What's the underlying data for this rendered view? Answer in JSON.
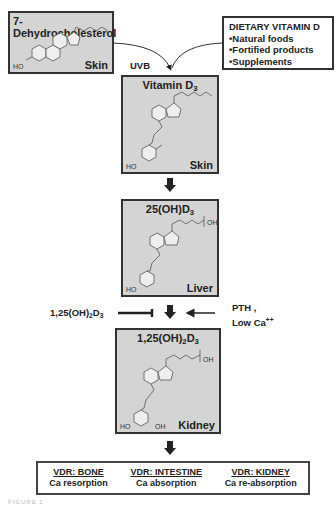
{
  "boxes": {
    "dehydrocholesterol": {
      "title": "7-Dehydrocholesterol",
      "location": "Skin",
      "ho": "HO"
    },
    "vitamin_d3": {
      "title_main": "Vitamin D",
      "title_sub": "3",
      "location": "Skin",
      "ho": "HO"
    },
    "hydroxy_d3": {
      "title_main": "25(OH)D",
      "title_sub": "3",
      "location": "Liver",
      "ho": "HO",
      "oh": "OH"
    },
    "calcitriol": {
      "title_prefix": "1,25(OH)",
      "title_sub1": "2",
      "title_mid": "D",
      "title_sub2": "3",
      "location": "Kidney",
      "ho": "HO",
      "oh": "OH",
      "oh2": "OH"
    }
  },
  "dietary": {
    "title": "DIETARY VITAMIN D",
    "items": [
      "•Natural foods",
      "•Fortified products",
      "•Supplements"
    ]
  },
  "labels": {
    "uvb": "UVB",
    "inhibitor_prefix": "1,25(OH)",
    "inhibitor_sub1": "2",
    "inhibitor_mid": "D",
    "inhibitor_sub2": "3",
    "pth": "PTH ,",
    "low_ca": "Low Ca",
    "low_ca_sup": "++"
  },
  "vdr": [
    {
      "header": "VDR: BONE",
      "effect": "Ca resorption"
    },
    {
      "header": "VDR: INTESTINE",
      "effect": "Ca absorption"
    },
    {
      "header": "VDR: KIDNEY",
      "effect": "Ca re-absorption"
    }
  ],
  "caption": "FIGURE 1"
}
